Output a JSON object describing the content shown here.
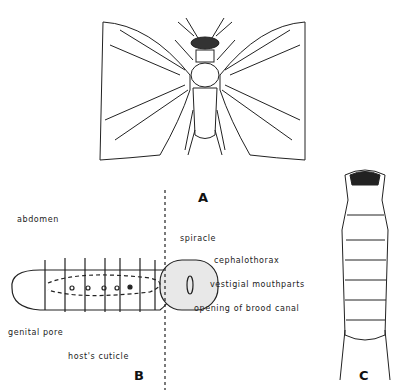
{
  "figure": {
    "panels": [
      {
        "id": "A",
        "label": "A",
        "subject": "adult winged male (dorsal view)"
      },
      {
        "id": "B",
        "label": "B",
        "subject": "female embedded in host"
      },
      {
        "id": "C",
        "label": "C",
        "subject": "triungulin larva"
      }
    ],
    "panel_b_labels": {
      "abdomen": "abdomen",
      "spiracle": "spiracle",
      "cephalothorax": "cephalothorax",
      "mouthparts": "vestigial mouthparts",
      "brood_canal": "opening of brood canal",
      "genital_pore": "genital pore",
      "cuticle": "host's cuticle"
    }
  }
}
